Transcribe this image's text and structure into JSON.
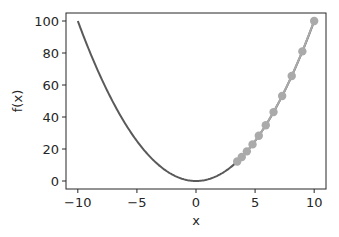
{
  "chart_data": {
    "type": "line",
    "title": "",
    "xlabel": "x",
    "ylabel": "f(x)",
    "xlim": [
      -11,
      11
    ],
    "ylim": [
      -5,
      105
    ],
    "xticks": [
      -10,
      -5,
      0,
      5,
      10
    ],
    "yticks": [
      0,
      20,
      40,
      60,
      80,
      100
    ],
    "xtick_labels": [
      "−10",
      "−5",
      "0",
      "5",
      "10"
    ],
    "ytick_labels": [
      "0",
      "20",
      "40",
      "60",
      "80",
      "100"
    ],
    "grid": false,
    "legend": null,
    "series": [
      {
        "name": "f(x) = x^2",
        "kind": "curve",
        "function": "x^2",
        "x_range": [
          -10,
          10
        ],
        "color": "#5a5a5a"
      },
      {
        "name": "gradient descent trajectory",
        "kind": "line-markers",
        "color": "#aaaaaa",
        "x": [
          10.0,
          9.0,
          8.1,
          7.29,
          6.561,
          5.905,
          5.314,
          4.783,
          4.305,
          3.874,
          3.487
        ],
        "y": [
          100.0,
          81.0,
          65.61,
          53.14,
          43.05,
          34.87,
          28.24,
          22.88,
          18.53,
          15.01,
          12.16
        ]
      }
    ]
  }
}
